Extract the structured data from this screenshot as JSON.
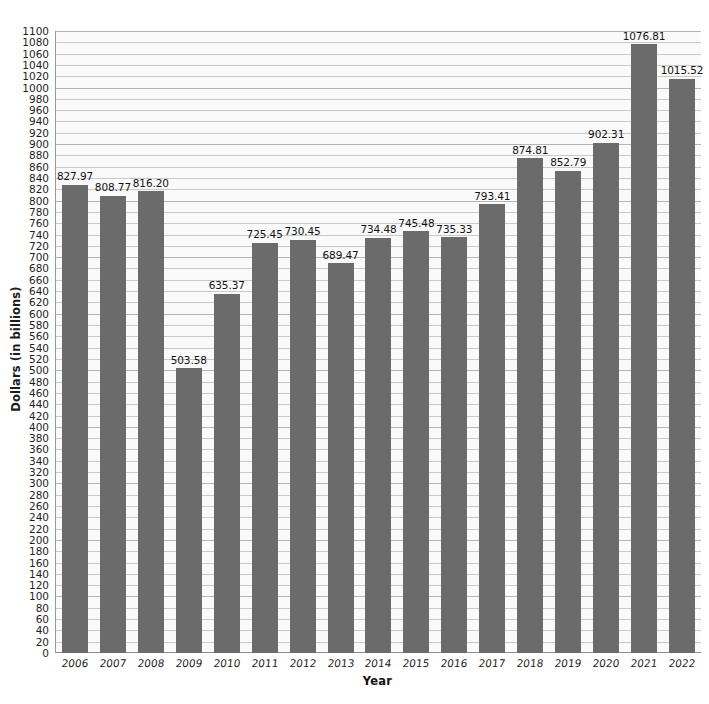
{
  "chart_data": {
    "type": "bar",
    "title": "",
    "subtitle": "",
    "xlabel": "Year",
    "ylabel": "Dollars (in billions)",
    "categories": [
      "2006",
      "2007",
      "2008",
      "2009",
      "2010",
      "2011",
      "2012",
      "2013",
      "2014",
      "2015",
      "2016",
      "2017",
      "2018",
      "2019",
      "2020",
      "2021",
      "2022"
    ],
    "values": [
      827.97,
      808.77,
      816.2,
      503.58,
      635.37,
      725.45,
      730.45,
      689.47,
      734.48,
      745.48,
      735.33,
      793.41,
      874.81,
      852.79,
      902.31,
      1076.81,
      1015.52
    ],
    "value_labels": [
      "827.97",
      "808.77",
      "816.20",
      "503.58",
      "635.37",
      "725.45",
      "730.45",
      "689.47",
      "734.48",
      "745.48",
      "735.33",
      "793.41",
      "874.81",
      "852.79",
      "902.31",
      "1076.81",
      "1015.52"
    ],
    "ylim": [
      0,
      1100
    ],
    "ytick_step": 20,
    "yticks": [
      0,
      20,
      40,
      60,
      80,
      100,
      120,
      140,
      160,
      180,
      200,
      220,
      240,
      260,
      280,
      300,
      320,
      340,
      360,
      380,
      400,
      420,
      440,
      460,
      480,
      500,
      520,
      540,
      560,
      580,
      600,
      620,
      640,
      660,
      680,
      700,
      720,
      740,
      760,
      780,
      800,
      820,
      840,
      860,
      880,
      900,
      920,
      940,
      960,
      980,
      1000,
      1020,
      1040,
      1060,
      1080,
      1100
    ],
    "grid": true,
    "legend": false,
    "legend_position": "none",
    "bar_color": "#6b6b6b",
    "plot_background": "#fafafa",
    "gridline_color": "#c9c9c9",
    "axis_color": "#8d8d8d",
    "text_color": "#1e1e1e"
  }
}
